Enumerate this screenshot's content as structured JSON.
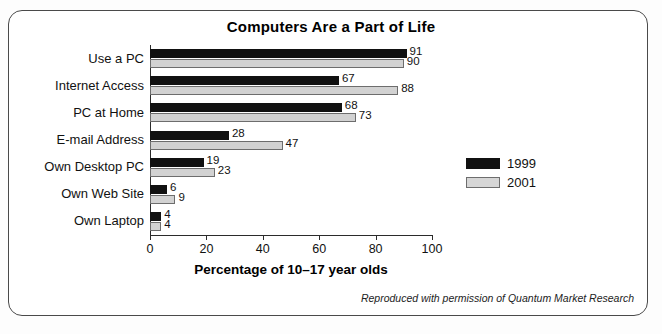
{
  "figure": {
    "title": "Computers Are a Part of Life",
    "credit": "Reproduced with permission of Quantum Market Research"
  },
  "chart_data": {
    "type": "bar",
    "orientation": "horizontal",
    "title": "Computers Are a Part of Life",
    "xlabel": "Percentage of 10–17 year olds",
    "ylabel": "",
    "xlim": [
      0,
      100
    ],
    "xticks": [
      0,
      20,
      40,
      60,
      80,
      100
    ],
    "xtick_labels": [
      "0",
      "20",
      "40",
      "60",
      "80",
      "100"
    ],
    "grid": false,
    "legend_position": "center-right",
    "categories": [
      "Use a PC",
      "Internet Access",
      "PC at Home",
      "E-mail Address",
      "Own Desktop PC",
      "Own Web Site",
      "Own Laptop"
    ],
    "series": [
      {
        "name": "1999",
        "color": "#111111",
        "values": [
          91,
          67,
          68,
          28,
          19,
          6,
          4
        ],
        "labels": [
          "91",
          "67",
          "68",
          "28",
          "19",
          "6",
          "4"
        ]
      },
      {
        "name": "2001",
        "color": "#d2d2d2",
        "values": [
          90,
          88,
          73,
          47,
          23,
          9,
          4
        ],
        "labels": [
          "90",
          "88",
          "73",
          "47",
          "23",
          "9",
          "4"
        ]
      }
    ]
  }
}
